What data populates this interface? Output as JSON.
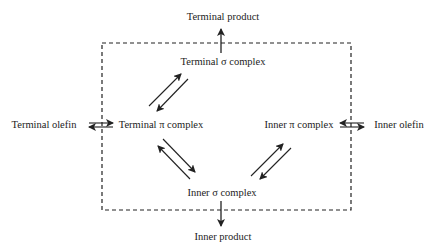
{
  "nodes": {
    "terminal_product": "Terminal product",
    "terminal_sigma": "Terminal σ complex",
    "terminal_olefin": "Terminal olefin",
    "terminal_pi": "Terminal π complex",
    "inner_pi": "Inner π complex",
    "inner_olefin": "Inner olefin",
    "inner_sigma": "Inner σ complex",
    "inner_product": "Inner product"
  },
  "colors": {
    "line": "#222222",
    "background": "#ffffff"
  }
}
